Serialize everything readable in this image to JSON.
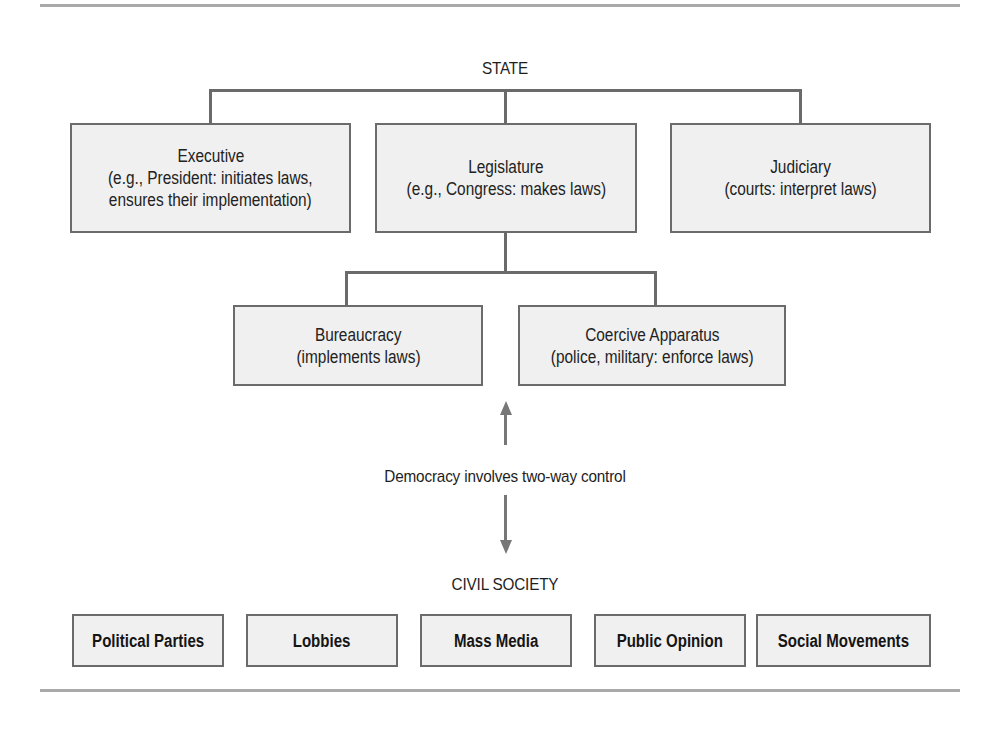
{
  "diagram": {
    "title_top": "STATE",
    "state_branches": [
      {
        "name": "Executive",
        "desc_line1": "(e.g., President: initiates laws,",
        "desc_line2": "ensures their implementation)"
      },
      {
        "name": "Legislature",
        "desc_line1": "(e.g., Congress: makes laws)"
      },
      {
        "name": "Judiciary",
        "desc_line1": "(courts: interpret laws)"
      }
    ],
    "legislature_children": [
      {
        "name": "Bureaucracy",
        "desc_line1": "(implements laws)"
      },
      {
        "name": "Coercive Apparatus",
        "desc_line1": "(police, military: enforce laws)"
      }
    ],
    "relation_label": "Democracy involves two-way control",
    "relation_icons": {
      "up": "arrow-up-icon",
      "down": "arrow-down-icon"
    },
    "title_bottom": "CIVIL SOCIETY",
    "civil_society": [
      {
        "name": "Political Parties"
      },
      {
        "name": "Lobbies"
      },
      {
        "name": "Mass Media"
      },
      {
        "name": "Public Opinion"
      },
      {
        "name": "Social Movements"
      }
    ],
    "colors": {
      "box_fill": "#f0f0f0",
      "box_border": "#6b6b6b",
      "connector": "#6a6a6a",
      "arrow": "#777777",
      "rule": "#a9a9a9"
    }
  }
}
